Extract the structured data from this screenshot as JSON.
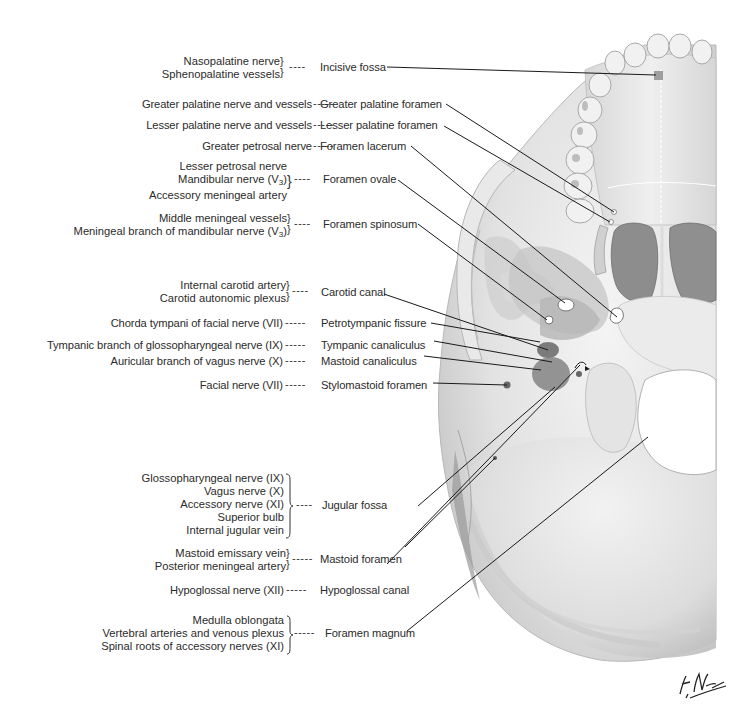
{
  "figure": {
    "signature": "F. Netter M.D.",
    "colors": {
      "background": "#ffffff",
      "bone_light": "#ececec",
      "bone_mid": "#cfcfcf",
      "bone_dark": "#9a9a9a",
      "leader_line": "#1a1a1a",
      "text": "#2b2b2b"
    }
  },
  "rows": [
    {
      "structures": [
        "Nasopalatine nerve",
        "Sphenopalatine vessels"
      ],
      "foramen": "Incisive fossa"
    },
    {
      "structures": [
        "Greater palatine nerve and vessels"
      ],
      "foramen": "Greater palatine foramen"
    },
    {
      "structures": [
        "Lesser palatine nerve and vessels"
      ],
      "foramen": "Lesser palatine foramen"
    },
    {
      "structures": [
        "Greater petrosal nerve"
      ],
      "foramen": "Foramen lacerum"
    },
    {
      "structures": [
        "Lesser petrosal nerve",
        "Mandibular nerve (V3)",
        "Accessory meningeal artery"
      ],
      "foramen": "Foramen ovale"
    },
    {
      "structures": [
        "Middle meningeal vessels",
        "Meningeal branch of mandibular nerve (V3)"
      ],
      "foramen": "Foramen spinosum"
    },
    {
      "structures": [
        "Internal carotid artery",
        "Carotid autonomic plexus"
      ],
      "foramen": "Carotid canal"
    },
    {
      "structures": [
        "Chorda tympani of facial nerve (VII)"
      ],
      "foramen": "Petrotympanic fissure"
    },
    {
      "structures": [
        "Tympanic branch of glossopharyngeal nerve (IX)"
      ],
      "foramen": "Tympanic canaliculus"
    },
    {
      "structures": [
        "Auricular branch of vagus nerve (X)"
      ],
      "foramen": "Mastoid canaliculus"
    },
    {
      "structures": [
        "Facial nerve (VII)"
      ],
      "foramen": "Stylomastoid foramen"
    },
    {
      "structures": [
        "Glossopharyngeal nerve (IX)",
        "Vagus nerve (X)",
        "Accessory nerve (XI)",
        "Superior bulb",
        "Internal jugular vein"
      ],
      "foramen": "Jugular fossa"
    },
    {
      "structures": [
        "Mastoid emissary vein",
        "Posterior meningeal artery"
      ],
      "foramen": "Mastoid foramen"
    },
    {
      "structures": [
        "Hypoglossal nerve (XII)"
      ],
      "foramen": "Hypoglossal canal"
    },
    {
      "structures": [
        "Medulla oblongata",
        "Vertebral arteries and venous plexus",
        "Spinal roots of accessory nerves (XI)"
      ],
      "foramen": "Foramen magnum"
    }
  ],
  "symbols": {
    "brace_open": "}",
    "brace_pair": "⎫",
    "dash_short": "----",
    "dash_long": "-----",
    "v3_base": "V",
    "v3_sub": "3"
  }
}
